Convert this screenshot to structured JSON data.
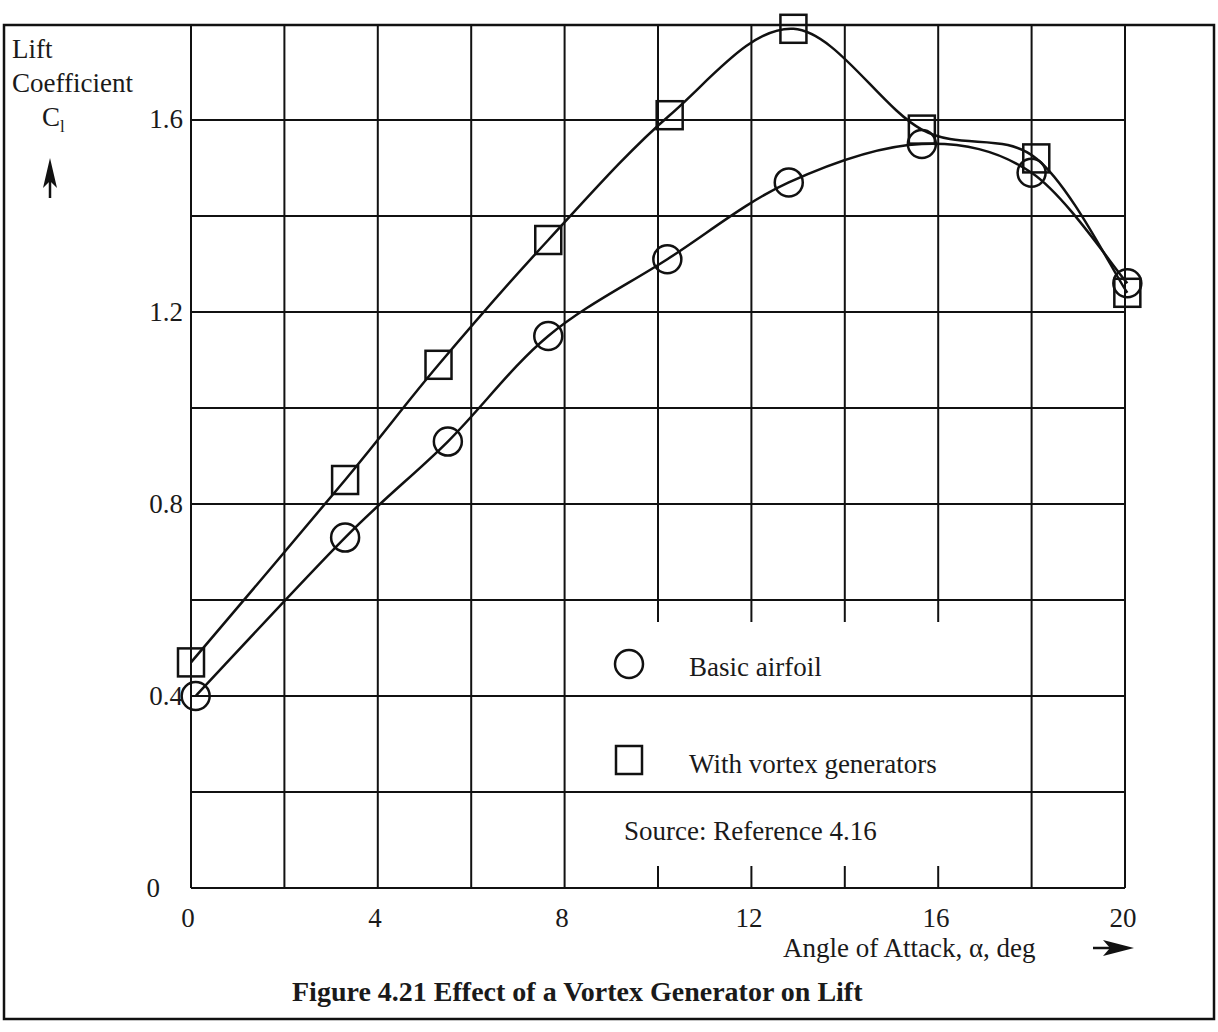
{
  "figure": {
    "caption": "Figure 4.21 Effect of a Vortex Generator on Lift",
    "source_note": "Source: Reference 4.16",
    "y_label_line1": "Lift",
    "y_label_line2": "Coefficient",
    "y_symbol": "C",
    "y_symbol_sub": "l",
    "x_label": "Angle of Attack, α, deg",
    "y_arrow_icon": "arrow-up-icon",
    "x_arrow_icon": "arrow-right-icon"
  },
  "legend": {
    "items": [
      {
        "marker": "circle",
        "label": "Basic airfoil"
      },
      {
        "marker": "square",
        "label": "With vortex generators"
      }
    ]
  },
  "axes": {
    "y_ticks": [
      {
        "value": 0,
        "label": "0"
      },
      {
        "value": 0.4,
        "label": "0.4"
      },
      {
        "value": 0.8,
        "label": "0.8"
      },
      {
        "value": 1.2,
        "label": "1.2"
      },
      {
        "value": 1.6,
        "label": "1.6"
      }
    ],
    "x_ticks": [
      {
        "value": 0,
        "label": "0"
      },
      {
        "value": 4,
        "label": "4"
      },
      {
        "value": 8,
        "label": "8"
      },
      {
        "value": 12,
        "label": "12"
      },
      {
        "value": 16,
        "label": "16"
      },
      {
        "value": 20,
        "label": "20"
      }
    ]
  },
  "chart_data": {
    "type": "line",
    "title": "Figure 4.21 Effect of a Vortex Generator on Lift",
    "xlabel": "Angle of Attack, α, deg",
    "ylabel": "Lift Coefficient C_l",
    "xlim": [
      0,
      20
    ],
    "ylim": [
      0,
      1.8
    ],
    "x_tick_labels": [
      "0",
      "4",
      "8",
      "12",
      "16",
      "20"
    ],
    "y_tick_labels": [
      "0",
      "0.4",
      "0.8",
      "1.2",
      "1.6"
    ],
    "grid": true,
    "grid_x_step": 2,
    "grid_y_step": 0.2,
    "legend_position": "lower right (inside plot)",
    "annotations": [
      "Source: Reference 4.16"
    ],
    "series": [
      {
        "name": "Basic airfoil",
        "marker": "circle",
        "x": [
          0.1,
          3.3,
          5.5,
          7.65,
          10.2,
          12.8,
          15.65,
          18.0,
          20.05
        ],
        "y": [
          0.4,
          0.73,
          0.93,
          1.15,
          1.31,
          1.47,
          1.55,
          1.49,
          1.26
        ]
      },
      {
        "name": "With vortex generators",
        "marker": "square",
        "x": [
          0.0,
          3.3,
          5.3,
          7.65,
          10.25,
          12.9,
          15.65,
          18.1,
          20.05
        ],
        "y": [
          0.47,
          0.85,
          1.09,
          1.35,
          1.61,
          1.79,
          1.58,
          1.52,
          1.24
        ]
      }
    ]
  }
}
